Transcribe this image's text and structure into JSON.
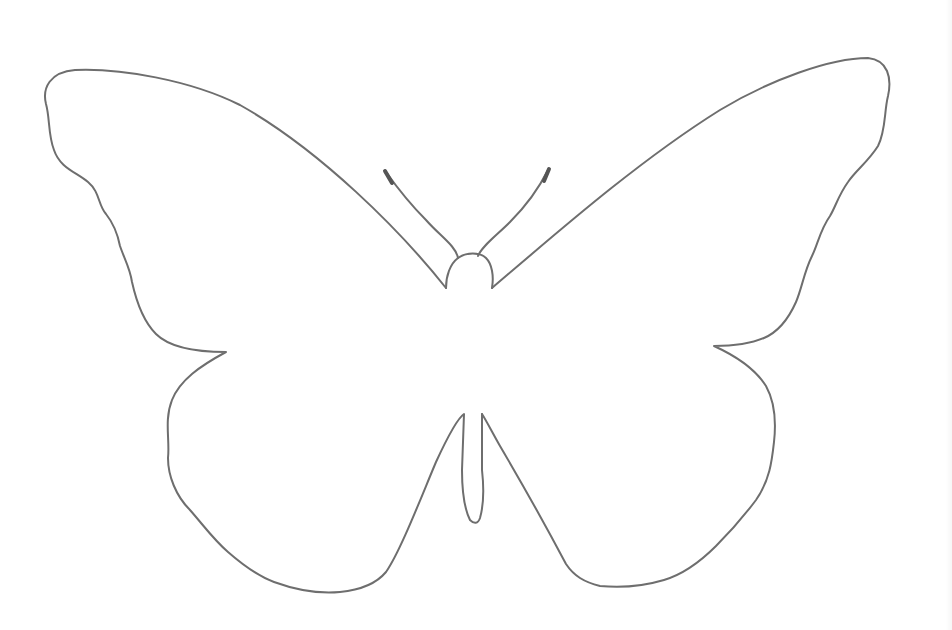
{
  "image": {
    "subject": "Butterfly outline",
    "description": "Line-art outline of a butterfly with open wings, antennae, head and slender abdomen on white background",
    "colors": {
      "background": "#ffffff",
      "stroke": "#6e6e6e",
      "antenna_tip": "#555555"
    }
  }
}
